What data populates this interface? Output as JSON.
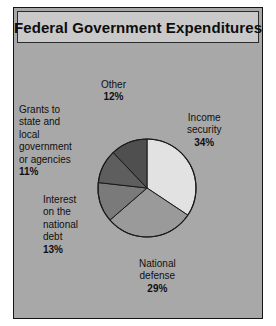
{
  "figure": {
    "title": "Federal Government Expenditures",
    "background_color": "#a8a8a8",
    "title_bar_color": "#c9c9c9",
    "border_color": "#141414"
  },
  "labels": {
    "other": {
      "name": "Other",
      "lines": [
        "Other"
      ],
      "percent": "12%"
    },
    "grants": {
      "name": "Grants to state and local government or agencies",
      "lines": [
        "Grants to",
        "state and",
        "local",
        "government",
        "or agencies"
      ],
      "percent": "11%"
    },
    "interest": {
      "name": "Interest on the national debt",
      "lines": [
        "Interest",
        "on the",
        "national",
        "debt"
      ],
      "percent": "13%"
    },
    "income": {
      "name": "Income security",
      "lines": [
        "Income",
        "security"
      ],
      "percent": "34%"
    },
    "defense": {
      "name": "National defense",
      "lines": [
        "National",
        "defense"
      ],
      "percent": "29%"
    }
  },
  "chart_data": {
    "type": "pie",
    "title": "Federal Government Expenditures",
    "xlabel": "",
    "ylabel": "",
    "legend_position": "none",
    "grid": false,
    "start_angle_deg": 0,
    "direction": "clockwise",
    "units": "percent of total expenditures",
    "categories": [
      "Income security",
      "National defense",
      "Interest on the national debt",
      "Grants to state and local government or agencies",
      "Other"
    ],
    "values": [
      34,
      29,
      13,
      11,
      12
    ],
    "labels": [
      "34%",
      "29%",
      "13%",
      "11%",
      "12%"
    ],
    "colors": [
      "#e2e2e2",
      "#9a9a9a",
      "#7a7a7a",
      "#5e5e5e",
      "#4f4f4f"
    ],
    "slice_edge_color": "#1a1a1a",
    "total": 99
  }
}
